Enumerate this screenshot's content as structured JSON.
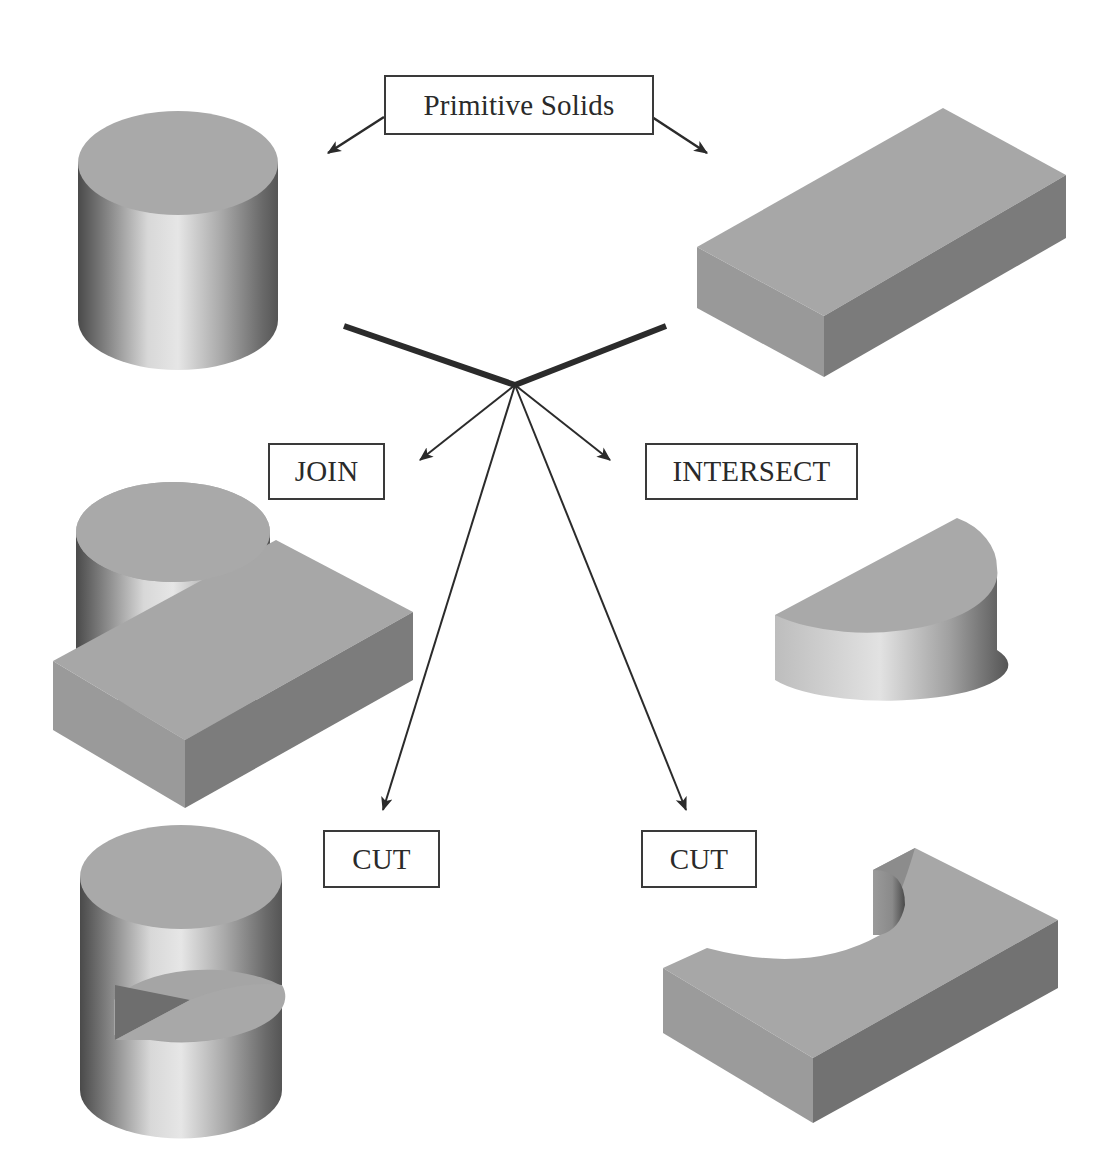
{
  "diagram": {
    "title_box": {
      "label": "Primitive Solids"
    },
    "operations": [
      {
        "id": "join",
        "label": "JOIN"
      },
      {
        "id": "intersect",
        "label": "INTERSECT"
      },
      {
        "id": "cut_left",
        "label": "CUT"
      },
      {
        "id": "cut_right",
        "label": "CUT"
      }
    ],
    "solids": [
      {
        "id": "cylinder",
        "name": "Cylinder primitive"
      },
      {
        "id": "block",
        "name": "Rectangular block primitive"
      },
      {
        "id": "join_result",
        "name": "Cylinder joined with block"
      },
      {
        "id": "intersect_result",
        "name": "Half-cylinder intersection"
      },
      {
        "id": "cut_cylinder_result",
        "name": "Cylinder cut by block"
      },
      {
        "id": "cut_block_result",
        "name": "Block cut by cylinder"
      }
    ],
    "colors": {
      "flat_face": "#a9a9a9",
      "dark_face": "#7c7c7c",
      "line": "#2b2b2b",
      "box_border": "#3a3a3a"
    }
  }
}
